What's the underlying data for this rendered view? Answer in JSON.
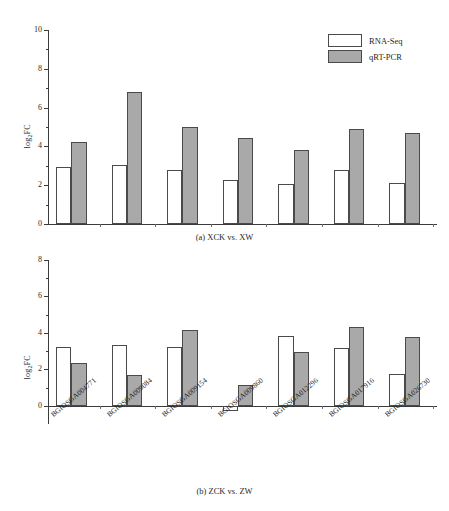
{
  "chart_data": [
    {
      "type": "bar",
      "panel": "a",
      "title": "(a) XCK vs. XW",
      "xlabel": "",
      "ylabel": "log2FC",
      "ylabel_base": "log",
      "ylabel_sub": "2",
      "ylabel_tail": "FC",
      "ylim": [
        0,
        10
      ],
      "yticks": [
        0,
        2,
        4,
        6,
        8,
        10
      ],
      "ytick_labels": [
        "0",
        "2",
        "4",
        "6",
        "8",
        "10"
      ],
      "yminor": [
        1,
        3,
        5,
        7,
        9
      ],
      "grid": false,
      "legend_position": "top-right",
      "categories": [
        "BGIOSGA004771",
        "BGIOSGA009084",
        "BGIOSGA009154",
        "BGIOSGA009860",
        "BGIOSGA012296",
        "BGIOSGA017916",
        "BGIOSGA026730"
      ],
      "series": [
        {
          "name": "RNA-Seq",
          "color": "#ffffff",
          "values": [
            2.95,
            3.05,
            2.8,
            2.25,
            2.05,
            2.8,
            2.1
          ]
        },
        {
          "name": "qRT-PCR",
          "color": "#a9a9a9",
          "values": [
            4.25,
            6.8,
            5.0,
            4.45,
            3.8,
            4.9,
            4.7
          ]
        }
      ]
    },
    {
      "type": "bar",
      "panel": "b",
      "title": "(b) ZCK vs. ZW",
      "xlabel": "",
      "ylabel": "log2FC",
      "ylabel_base": "log",
      "ylabel_sub": "2",
      "ylabel_tail": "FC",
      "ylim": [
        -1,
        8
      ],
      "yticks": [
        0,
        2,
        4,
        6,
        8
      ],
      "ytick_labels": [
        "0",
        "2",
        "4",
        "6",
        "8"
      ],
      "yminor": [
        1,
        3,
        5,
        7
      ],
      "grid": false,
      "legend_position": "none",
      "categories": [
        "BGIOSGA004771",
        "BGIOSGA009084",
        "BGIOSGA009154",
        "BGIOSGA009860",
        "BGIOSGA012296",
        "BGIOSGA017916",
        "BGIOSGA026730"
      ],
      "series": [
        {
          "name": "RNA-Seq",
          "color": "#ffffff",
          "values": [
            3.2,
            3.35,
            3.2,
            -0.3,
            3.85,
            3.15,
            1.75
          ]
        },
        {
          "name": "qRT-PCR",
          "color": "#a9a9a9",
          "values": [
            2.35,
            1.7,
            4.15,
            1.15,
            2.95,
            4.35,
            3.75
          ]
        }
      ]
    }
  ],
  "legend": {
    "items": [
      {
        "label": "RNA-Seq",
        "style": "rna"
      },
      {
        "label": "qRT-PCR",
        "style": "qrt"
      }
    ]
  }
}
